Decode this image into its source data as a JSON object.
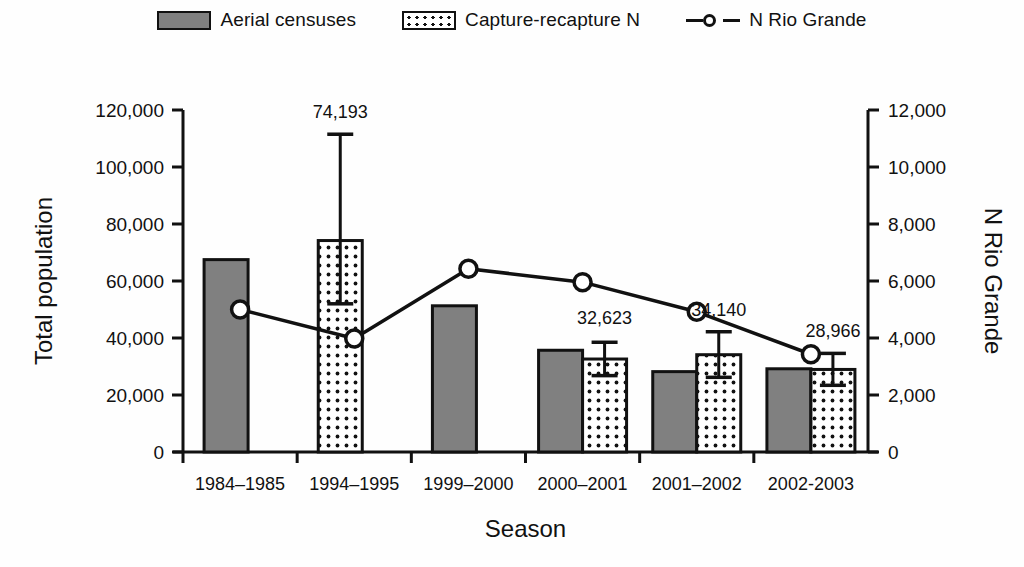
{
  "legend": {
    "items": [
      {
        "label": "Aerial censuses",
        "icon": "solid-gray-swatch-icon"
      },
      {
        "label": "Capture-recapture N",
        "icon": "dotted-swatch-icon"
      },
      {
        "label": "N Rio Grande",
        "icon": "line-marker-icon"
      }
    ]
  },
  "chart_data": {
    "type": "bar",
    "title": "",
    "xlabel": "Season",
    "ylabel": "Total population",
    "y2label": "N Rio Grande",
    "categories": [
      "1984–1985",
      "1994–1995",
      "1999–2000",
      "2000–2001",
      "2001–2002",
      "2002-2003"
    ],
    "ylim": [
      0,
      120000
    ],
    "yticks": [
      0,
      20000,
      40000,
      60000,
      80000,
      100000,
      120000
    ],
    "ytick_labels": [
      "0",
      "20,000",
      "40,000",
      "60,000",
      "80,000",
      "100,000",
      "120,000"
    ],
    "y2lim": [
      0,
      12000
    ],
    "y2ticks": [
      0,
      2000,
      4000,
      6000,
      8000,
      10000,
      12000
    ],
    "y2tick_labels": [
      "0",
      "2,000",
      "4,000",
      "6,000",
      "8,000",
      "10,000",
      "12,000"
    ],
    "grid": false,
    "legend_position": "top",
    "series": [
      {
        "name": "Aerial censuses",
        "type": "bar",
        "axis": "left",
        "values": [
          67500,
          null,
          51300,
          35700,
          28200,
          29200
        ]
      },
      {
        "name": "Capture-recapture N",
        "type": "bar",
        "axis": "left",
        "values": [
          null,
          74193,
          null,
          32623,
          34140,
          28966
        ],
        "error_high": [
          null,
          111500,
          null,
          38500,
          42200,
          34600
        ],
        "error_low": [
          null,
          52000,
          null,
          26800,
          26200,
          23400
        ],
        "data_labels": [
          null,
          "74,193",
          null,
          "32,623",
          "34,140",
          "28,966"
        ]
      },
      {
        "name": "N Rio Grande",
        "type": "line",
        "axis": "right",
        "values": [
          5000,
          3980,
          6430,
          5960,
          4920,
          3430
        ]
      }
    ]
  },
  "colors": {
    "bar_solid": "#808080",
    "bar_dotted": "#ffffff",
    "outline": "#111111",
    "line": "#111111",
    "background": "#fefefe"
  }
}
